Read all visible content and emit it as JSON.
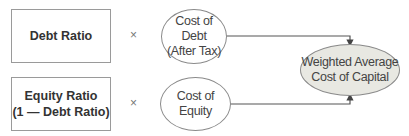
{
  "diagram": {
    "boxes": [
      {
        "label_line1": "Debt Ratio",
        "label_line2": ""
      },
      {
        "label_line1": "Equity Ratio",
        "label_line2": "(1 — Debt Ratio)"
      }
    ],
    "operator": "×",
    "cost_nodes": [
      {
        "label_line1": "Cost of Debt",
        "label_line2": "(After Tax)"
      },
      {
        "label_line1": "Cost of Equity",
        "label_line2": ""
      }
    ],
    "result_node": {
      "label_line1": "Weighted Average",
      "label_line2": "Cost of Capital"
    },
    "colors": {
      "result_fill": "#e8e8e2",
      "line": "#555555",
      "border": "#9a9a9a"
    }
  }
}
